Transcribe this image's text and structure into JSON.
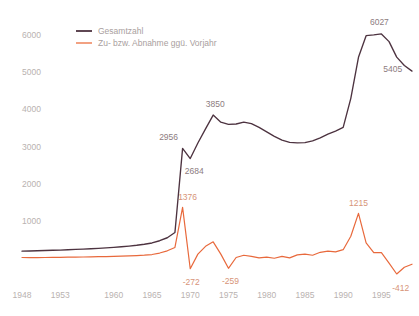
{
  "chart_data": {
    "type": "line",
    "title": "",
    "xlabel": "",
    "ylabel": "",
    "xlim": [
      1948,
      1999
    ],
    "ylim": [
      -600,
      6400
    ],
    "grid": false,
    "legend_position": "top-left",
    "yticks": [
      1000,
      2000,
      3000,
      4000,
      5000,
      6000
    ],
    "ytick_labels": [
      "1000",
      "2000",
      "3000",
      "4000",
      "5000",
      "6000"
    ],
    "xticks": [
      1948,
      1953,
      1960,
      1965,
      1970,
      1975,
      1980,
      1985,
      1990,
      1995
    ],
    "xtick_labels": [
      "1948",
      "1953",
      "1960",
      "1965",
      "1970",
      "1975",
      "1980",
      "1985",
      "1990",
      "1995"
    ],
    "x": [
      1948,
      1949,
      1950,
      1951,
      1952,
      1953,
      1954,
      1955,
      1956,
      1957,
      1958,
      1959,
      1960,
      1961,
      1962,
      1963,
      1964,
      1965,
      1966,
      1967,
      1968,
      1969,
      1970,
      1971,
      1972,
      1973,
      1974,
      1975,
      1976,
      1977,
      1978,
      1979,
      1980,
      1981,
      1982,
      1983,
      1984,
      1985,
      1986,
      1987,
      1988,
      1989,
      1990,
      1991,
      1992,
      1993,
      1994,
      1995,
      1996,
      1997,
      1998,
      1999
    ],
    "series": [
      {
        "name": "Gesamtzahl",
        "color": "#4d3340",
        "values": [
          200,
          205,
          212,
          218,
          224,
          230,
          238,
          247,
          256,
          266,
          277,
          289,
          302,
          318,
          336,
          358,
          385,
          420,
          480,
          560,
          700,
          2956,
          2684,
          3100,
          3480,
          3850,
          3660,
          3600,
          3610,
          3660,
          3620,
          3520,
          3400,
          3280,
          3180,
          3120,
          3105,
          3110,
          3160,
          3240,
          3340,
          3420,
          3520,
          4300,
          5400,
          5980,
          6000,
          6027,
          5820,
          5405,
          5180,
          5030
        ]
      },
      {
        "name": "Zu- bzw. Abnahme ggü. Vorjahr",
        "color": "#e8693c",
        "values": [
          30,
          28,
          26,
          30,
          32,
          34,
          38,
          42,
          44,
          48,
          52,
          56,
          60,
          66,
          72,
          80,
          92,
          110,
          150,
          210,
          300,
          1376,
          -272,
          120,
          330,
          450,
          120,
          -259,
          30,
          90,
          60,
          20,
          40,
          10,
          60,
          20,
          100,
          120,
          90,
          170,
          200,
          180,
          240,
          600,
          1215,
          420,
          160,
          160,
          -120,
          -412,
          -230,
          -150
        ]
      }
    ],
    "annotations": [
      {
        "label": "2956",
        "series": "Gesamtzahl",
        "x": 1969,
        "value": 2956
      },
      {
        "label": "2684",
        "series": "Gesamtzahl",
        "x": 1970,
        "value": 2684
      },
      {
        "label": "3850",
        "series": "Gesamtzahl",
        "x": 1973,
        "value": 3850
      },
      {
        "label": "6027",
        "series": "Gesamtzahl",
        "x": 1995,
        "value": 6027
      },
      {
        "label": "5405",
        "series": "Gesamtzahl",
        "x": 1997,
        "value": 5405
      },
      {
        "label": "1376",
        "series": "Zu- bzw. Abnahme ggü. Vorjahr",
        "x": 1969,
        "value": 1376
      },
      {
        "label": "-272",
        "series": "Zu- bzw. Abnahme ggü. Vorjahr",
        "x": 1970,
        "value": -272
      },
      {
        "label": "-259",
        "series": "Zu- bzw. Abnahme ggü. Vorjahr",
        "x": 1975,
        "value": -259
      },
      {
        "label": "1215",
        "series": "Zu- bzw. Abnahme ggü. Vorjahr",
        "x": 1992,
        "value": 1215
      },
      {
        "label": "-412",
        "series": "Zu- bzw. Abnahme ggü. Vorjahr",
        "x": 1997,
        "value": -412
      }
    ]
  },
  "legend": {
    "items": [
      {
        "label": "Gesamtzahl",
        "color": "#4d3340"
      },
      {
        "label": "Zu- bzw. Abnahme ggü. Vorjahr",
        "color": "#ef8a63"
      }
    ]
  }
}
